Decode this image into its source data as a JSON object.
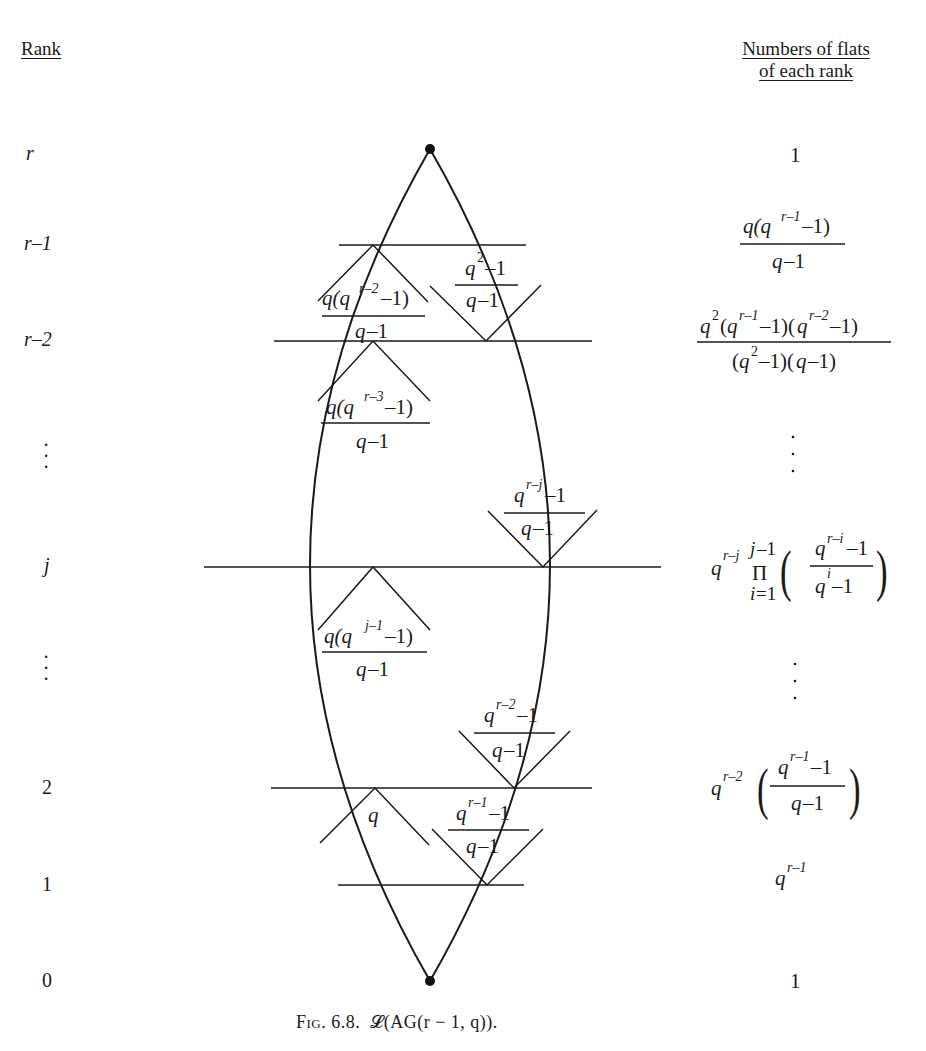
{
  "headers": {
    "rank": "Rank",
    "counts_line1": "Numbers of flats",
    "counts_line2": "of each rank"
  },
  "ranks": [
    {
      "label": "r",
      "y": 155
    },
    {
      "label": "r–1",
      "y": 245
    },
    {
      "label": "r–2",
      "y": 341
    },
    {
      "label": "⋮",
      "y": 460
    },
    {
      "label": "j",
      "y": 567
    },
    {
      "label": "⋮",
      "y": 680
    },
    {
      "label": "2",
      "y": 788
    },
    {
      "label": "1",
      "y": 885
    },
    {
      "label": "0",
      "y": 981
    }
  ],
  "counts": {
    "rank_r": "1",
    "rank_r_minus_1": {
      "num": "q(q^(r−1)−1)",
      "den": "q−1"
    },
    "rank_r_minus_2": {
      "num": "q^2(q^(r−1)−1)(q^(r−2)−1)",
      "den": "(q^2−1)(q−1)"
    },
    "rank_j": {
      "prefix": "q^(r−j)",
      "product": "Π_{i=1}^{j−1}",
      "num": "q^(r−i)−1",
      "den": "q^i−1"
    },
    "rank_2": {
      "prefix": "q^(r−2)",
      "num": "q^(r−1)−1",
      "den": "q−1"
    },
    "rank_1": "q^(r−1)",
    "rank_0": "1"
  },
  "edge_labels": {
    "up_from_r_minus_2": {
      "num": "q(q^(r−2)−1)",
      "den": "q−1"
    },
    "down_from_r_minus_1": {
      "num": "q^2−1",
      "den": "q−1"
    },
    "up_from_r_minus_3": {
      "num": "q(q^(r−3)−1)",
      "den": "q−1"
    },
    "down_to_j": {
      "num": "q^(r−j)−1",
      "den": "q−1"
    },
    "up_from_j": {
      "num": "q(q^(j−1)−1)",
      "den": "q−1"
    },
    "down_to_2": {
      "num": "q^(r−2)−1",
      "den": "q−1"
    },
    "up_from_1": "q",
    "down_to_1": {
      "num": "q^(r−1)−1",
      "den": "q−1"
    }
  },
  "caption": {
    "fig": "Fig. 6.8.",
    "title": "𝓛(AG(r − 1, q))."
  }
}
